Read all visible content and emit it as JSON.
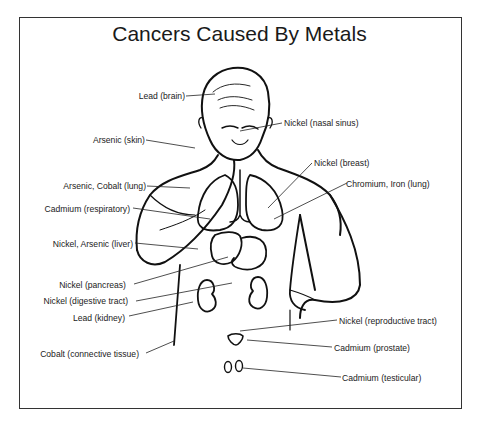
{
  "title": "Cancers Caused By Metals",
  "labels": {
    "lead_brain": "Lead (brain)",
    "nickel_nasal": "Nickel (nasal sinus)",
    "arsenic_skin": "Arsenic (skin)",
    "nickel_breast": "Nickel (breast)",
    "arsenic_cobalt_lung": "Arsenic, Cobalt (lung)",
    "chromium_iron_lung": "Chromium, Iron (lung)",
    "cadmium_respiratory": "Cadmium (respiratory)",
    "nickel_arsenic_liver": "Nickel, Arsenic (liver)",
    "nickel_pancreas": "Nickel (pancreas)",
    "nickel_digestive": "Nickel (digestive tract)",
    "lead_kidney": "Lead (kidney)",
    "cobalt_connective": "Cobalt (connective tissue)",
    "nickel_reproductive": "Nickel (reproductive tract)",
    "cadmium_prostate": "Cadmium (prostate)",
    "cadmium_testicular": "Cadmium (testicular)"
  }
}
